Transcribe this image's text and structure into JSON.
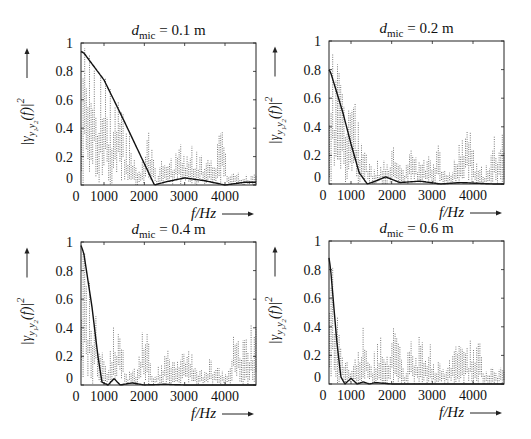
{
  "figure": {
    "panels": [
      {
        "id": "d01",
        "title_var": "d",
        "title_sub": "mic",
        "title_rest": " = 0.1 m",
        "d_mic_m": 0.1,
        "frame": {
          "left": 81,
          "top": 43,
          "right": 256,
          "bottom": 185
        },
        "xlabel": "f/Hz",
        "ylabel": "|γy1y2(f)|²",
        "xticks": [
          {
            "label": "0",
            "px": 76
          },
          {
            "label": "1000",
            "px": 104
          },
          {
            "label": "2000",
            "px": 144
          },
          {
            "label": "3000",
            "px": 184
          },
          {
            "label": "4000",
            "px": 225
          }
        ],
        "yticks": [
          "0",
          "0.2",
          "0.4",
          "0.6",
          "0.8",
          "1"
        ]
      },
      {
        "id": "d02",
        "title_var": "d",
        "title_sub": "mic",
        "title_rest": " = 0.2 m",
        "d_mic_m": 0.2,
        "frame": {
          "left": 329,
          "top": 41,
          "right": 504,
          "bottom": 184
        },
        "xlabel": "f/Hz",
        "ylabel": "|γy1y2(f)|²",
        "xticks": [
          {
            "label": "0",
            "px": 323
          },
          {
            "label": "1000",
            "px": 351
          },
          {
            "label": "2000",
            "px": 392
          },
          {
            "label": "3000",
            "px": 432
          },
          {
            "label": "4000",
            "px": 473
          }
        ],
        "yticks": [
          "0",
          "0.2",
          "0.4",
          "0.6",
          "0.8",
          "1"
        ]
      },
      {
        "id": "d04",
        "title_var": "d",
        "title_sub": "mic",
        "title_rest": " = 0.4 m",
        "d_mic_m": 0.4,
        "frame": {
          "left": 81,
          "top": 242,
          "right": 256,
          "bottom": 385
        },
        "xlabel": "f/Hz",
        "ylabel": "|γy1y2(f)|²",
        "xticks": [
          {
            "label": "0",
            "px": 76
          },
          {
            "label": "1000",
            "px": 104
          },
          {
            "label": "2000",
            "px": 144
          },
          {
            "label": "3000",
            "px": 184
          },
          {
            "label": "4000",
            "px": 225
          }
        ],
        "yticks": [
          "0",
          "0.2",
          "0.4",
          "0.6",
          "0.8",
          "1"
        ]
      },
      {
        "id": "d06",
        "title_var": "d",
        "title_sub": "mic",
        "title_rest": " = 0.6 m",
        "d_mic_m": 0.6,
        "frame": {
          "left": 329,
          "top": 241,
          "right": 504,
          "bottom": 384
        },
        "xlabel": "f/Hz",
        "ylabel": "|γy1y2(f)|²",
        "xticks": [
          {
            "label": "0",
            "px": 323
          },
          {
            "label": "1000",
            "px": 351
          },
          {
            "label": "2000",
            "px": 392
          },
          {
            "label": "3000",
            "px": 432
          },
          {
            "label": "4000",
            "px": 473
          }
        ],
        "yticks": [
          "0",
          "0.2",
          "0.4",
          "0.6",
          "0.8",
          "1"
        ]
      }
    ]
  },
  "chart_data": [
    {
      "type": "line",
      "title": "d_mic = 0.1 m",
      "xlabel": "f/Hz",
      "ylabel": "|γ_y1y2(f)|²",
      "xlim": [
        0,
        4600
      ],
      "ylim": [
        0,
        1
      ],
      "xticks": [
        0,
        1000,
        2000,
        3000,
        4000
      ],
      "yticks": [
        0,
        0.2,
        0.4,
        0.6,
        0.8,
        1
      ],
      "grid": false,
      "series": [
        {
          "name": "theoretical (solid)",
          "style": "solid",
          "x": [
            0,
            500,
            1000,
            1500,
            2000,
            2250,
            2500,
            3000,
            3500,
            4000,
            4500
          ],
          "y": [
            1.0,
            0.93,
            0.74,
            0.45,
            0.15,
            0.0,
            0.02,
            0.05,
            0.03,
            0.0,
            0.02
          ]
        },
        {
          "name": "measured (dotted)",
          "style": "dotted",
          "x": [
            500,
            800,
            1000,
            1200,
            1400,
            1600,
            1800,
            2000,
            2100,
            2300,
            2500,
            2700,
            2900,
            3100,
            3300,
            3500,
            3700,
            3900,
            4100,
            4300,
            4500
          ],
          "y": [
            0.98,
            0.9,
            0.88,
            0.7,
            0.6,
            0.4,
            0.2,
            0.22,
            0.5,
            0.08,
            0.25,
            0.22,
            0.32,
            0.3,
            0.27,
            0.26,
            0.15,
            0.44,
            0.08,
            0.1,
            0.08
          ]
        }
      ]
    },
    {
      "type": "line",
      "title": "d_mic = 0.2 m",
      "xlabel": "f/Hz",
      "ylabel": "|γ_y1y2(f)|²",
      "xlim": [
        0,
        4600
      ],
      "ylim": [
        0,
        1
      ],
      "xticks": [
        0,
        1000,
        2000,
        3000,
        4000
      ],
      "yticks": [
        0,
        0.2,
        0.4,
        0.6,
        0.8,
        1
      ],
      "grid": false,
      "series": [
        {
          "name": "theoretical (solid)",
          "style": "solid",
          "x": [
            0,
            500,
            800,
            1000,
            1200,
            1400,
            1600,
            1850,
            2200,
            2700,
            3200,
            3700,
            4500
          ],
          "y": [
            1.0,
            0.78,
            0.5,
            0.28,
            0.08,
            0.0,
            0.02,
            0.05,
            0.01,
            0.02,
            0.0,
            0.01,
            0.0
          ]
        },
        {
          "name": "measured (dotted)",
          "style": "dotted",
          "x": [
            500,
            700,
            900,
            1100,
            1300,
            1500,
            1700,
            1900,
            2100,
            2300,
            2500,
            2700,
            2900,
            3100,
            3300,
            3500,
            3700,
            3900,
            4100,
            4300,
            4500
          ],
          "y": [
            0.95,
            0.88,
            0.72,
            0.68,
            0.3,
            0.14,
            0.19,
            0.22,
            0.28,
            0.15,
            0.27,
            0.22,
            0.24,
            0.34,
            0.13,
            0.15,
            0.32,
            0.43,
            0.16,
            0.12,
            0.4
          ]
        }
      ]
    },
    {
      "type": "line",
      "title": "d_mic = 0.4 m",
      "xlabel": "f/Hz",
      "ylabel": "|γ_y1y2(f)|²",
      "xlim": [
        0,
        4600
      ],
      "ylim": [
        0,
        1
      ],
      "xticks": [
        0,
        1000,
        2000,
        3000,
        4000
      ],
      "yticks": [
        0,
        0.2,
        0.4,
        0.6,
        0.8,
        1
      ],
      "grid": false,
      "series": [
        {
          "name": "theoretical (solid)",
          "style": "solid",
          "x": [
            400,
            500,
            700,
            850,
            950,
            1100,
            1250,
            1400,
            1700,
            2000,
            2500,
            3000,
            4500
          ],
          "y": [
            1.0,
            0.92,
            0.55,
            0.2,
            0.02,
            0.0,
            0.045,
            0.0,
            0.015,
            0.0,
            0.005,
            0.0,
            0.0
          ]
        },
        {
          "name": "measured (dotted)",
          "style": "dotted",
          "x": [
            500,
            700,
            800,
            1000,
            1100,
            1200,
            1300,
            1400,
            1600,
            1800,
            2000,
            2200,
            2400,
            2600,
            2800,
            3000,
            3200,
            3400,
            3600,
            3800,
            4000,
            4200,
            4500
          ],
          "y": [
            0.98,
            0.72,
            0.55,
            0.18,
            0.22,
            0.41,
            0.48,
            0.38,
            0.1,
            0.15,
            0.49,
            0.14,
            0.15,
            0.27,
            0.2,
            0.32,
            0.24,
            0.1,
            0.19,
            0.16,
            0.08,
            0.4,
            0.42
          ]
        }
      ]
    },
    {
      "type": "line",
      "title": "d_mic = 0.6 m",
      "xlabel": "f/Hz",
      "ylabel": "|γ_y1y2(f)|²",
      "xlim": [
        0,
        4600
      ],
      "ylim": [
        0,
        1
      ],
      "xticks": [
        0,
        1000,
        2000,
        3000,
        4000
      ],
      "yticks": [
        0,
        0.2,
        0.4,
        0.6,
        0.8,
        1
      ],
      "grid": false,
      "series": [
        {
          "name": "theoretical (solid)",
          "style": "solid",
          "x": [
            400,
            500,
            650,
            750,
            850,
            1000,
            1150,
            1300,
            1450,
            1600,
            2000,
            4500
          ],
          "y": [
            1.0,
            0.8,
            0.3,
            0.05,
            0.0,
            0.04,
            0.0,
            0.015,
            0.0,
            0.01,
            0.0,
            0.0
          ]
        },
        {
          "name": "measured (dotted)",
          "style": "dotted",
          "x": [
            500,
            700,
            800,
            900,
            1000,
            1200,
            1300,
            1500,
            1700,
            1900,
            2100,
            2300,
            2500,
            2700,
            2900,
            3100,
            3300,
            3500,
            3700,
            3900,
            4100,
            4300,
            4500
          ],
          "y": [
            0.98,
            0.45,
            0.32,
            0.25,
            0.18,
            0.37,
            0.4,
            0.15,
            0.39,
            0.2,
            0.49,
            0.1,
            0.39,
            0.33,
            0.35,
            0.19,
            0.15,
            0.28,
            0.29,
            0.33,
            0.37,
            0.13,
            0.13
          ]
        }
      ]
    }
  ]
}
